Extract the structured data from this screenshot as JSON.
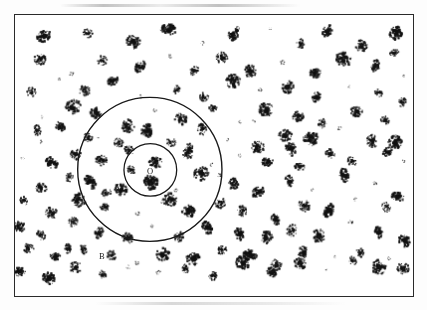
{
  "figure": {
    "type": "spatial-point-pattern",
    "frame": {
      "x": 14,
      "y": 14,
      "width": 400,
      "height": 283,
      "border_color": "#2a2a2a",
      "border_width": 1.6,
      "background_color": "#ffffff"
    },
    "ink_color": "#111111",
    "page_background": "#fdfdfd"
  },
  "labels": [
    {
      "id": "label-o",
      "text": "O",
      "x": 149,
      "y": 171,
      "note": "centre of the concentric circles, inside the small circle"
    },
    {
      "id": "label-a",
      "text": "A",
      "x": 116,
      "y": 187,
      "note": "annulus between the inner and outer circle"
    },
    {
      "id": "label-b",
      "text": "B",
      "x": 101,
      "y": 256,
      "note": "just outside the outer circle, lower left"
    }
  ],
  "circles": [
    {
      "id": "circle-inner",
      "cx": 150,
      "cy": 170,
      "r": 26.5,
      "stroke": "#1a1a1a",
      "stroke_width": 1.3
    },
    {
      "id": "circle-outer",
      "cx": 149.5,
      "cy": 169.5,
      "r": 72.5,
      "stroke": "#1a1a1a",
      "stroke_width": 1.4
    }
  ],
  "chart_data": {
    "type": "scatter",
    "title": "",
    "subtitle": "",
    "xlabel": "",
    "ylabel": "",
    "xlim": [
      0,
      400
    ],
    "ylim": [
      0,
      283
    ],
    "grid": false,
    "legend": null,
    "annotations": [
      {
        "text": "O",
        "x": 135,
        "y": 157
      },
      {
        "text": "A",
        "x": 102,
        "y": 173
      },
      {
        "text": "B",
        "x": 87,
        "y": 242
      }
    ],
    "overlays": [
      {
        "shape": "circle",
        "cx": 136,
        "cy": 156,
        "r": 26.5,
        "label": "inner circle about O"
      },
      {
        "shape": "circle",
        "cx": 135.5,
        "cy": 155.5,
        "r": 72.5,
        "label": "outer circle about O"
      }
    ],
    "marker_style": "irregular ink blob",
    "point_count": 178,
    "points": [
      [
        24,
        15
      ],
      [
        78,
        9
      ],
      [
        117,
        11
      ],
      [
        162,
        27
      ],
      [
        208,
        10
      ],
      [
        241,
        26
      ],
      [
        262,
        14
      ],
      [
        341,
        13
      ],
      [
        383,
        12
      ],
      [
        398,
        30
      ],
      [
        18,
        38
      ],
      [
        45,
        33
      ],
      [
        88,
        36
      ],
      [
        130,
        43
      ],
      [
        166,
        31
      ],
      [
        200,
        41
      ],
      [
        234,
        35
      ],
      [
        272,
        27
      ],
      [
        299,
        40
      ],
      [
        331,
        33
      ],
      [
        360,
        45
      ],
      [
        392,
        52
      ],
      [
        12,
        63
      ],
      [
        41,
        57
      ],
      [
        73,
        70
      ],
      [
        101,
        58
      ],
      [
        137,
        64
      ],
      [
        170,
        55
      ],
      [
        194,
        67
      ],
      [
        222,
        60
      ],
      [
        250,
        73
      ],
      [
        281,
        62
      ],
      [
        313,
        70
      ],
      [
        347,
        58
      ],
      [
        378,
        66
      ],
      [
        403,
        74
      ],
      [
        9,
        86
      ],
      [
        33,
        93
      ],
      [
        60,
        80
      ],
      [
        85,
        90
      ],
      [
        113,
        83
      ],
      [
        142,
        95
      ],
      [
        176,
        86
      ],
      [
        205,
        97
      ],
      [
        233,
        84
      ],
      [
        258,
        92
      ],
      [
        289,
        86
      ],
      [
        318,
        98
      ],
      [
        352,
        88
      ],
      [
        382,
        95
      ],
      [
        404,
        104
      ],
      [
        15,
        110
      ],
      [
        44,
        118
      ],
      [
        69,
        106
      ],
      [
        96,
        115
      ],
      [
        124,
        123
      ],
      [
        152,
        108
      ],
      [
        181,
        118
      ],
      [
        210,
        110
      ],
      [
        240,
        120
      ],
      [
        268,
        107
      ],
      [
        296,
        116
      ],
      [
        325,
        122
      ],
      [
        354,
        112
      ],
      [
        384,
        120
      ],
      [
        7,
        132
      ],
      [
        36,
        140
      ],
      [
        62,
        129
      ],
      [
        88,
        137
      ],
      [
        115,
        145
      ],
      [
        145,
        134
      ],
      [
        172,
        142
      ],
      [
        199,
        131
      ],
      [
        228,
        139
      ],
      [
        256,
        147
      ],
      [
        285,
        133
      ],
      [
        312,
        141
      ],
      [
        341,
        130
      ],
      [
        370,
        138
      ],
      [
        398,
        145
      ],
      [
        20,
        156
      ],
      [
        48,
        163
      ],
      [
        75,
        154
      ],
      [
        102,
        161
      ],
      [
        128,
        151
      ],
      [
        158,
        166
      ],
      [
        186,
        157
      ],
      [
        214,
        164
      ],
      [
        243,
        153
      ],
      [
        271,
        161
      ],
      [
        300,
        168
      ],
      [
        328,
        155
      ],
      [
        356,
        163
      ],
      [
        386,
        152
      ],
      [
        406,
        160
      ],
      [
        11,
        178
      ],
      [
        38,
        186
      ],
      [
        66,
        176
      ],
      [
        93,
        184
      ],
      [
        120,
        192
      ],
      [
        148,
        180
      ],
      [
        175,
        188
      ],
      [
        204,
        177
      ],
      [
        232,
        185
      ],
      [
        260,
        193
      ],
      [
        288,
        181
      ],
      [
        316,
        189
      ],
      [
        345,
        178
      ],
      [
        373,
        186
      ],
      [
        400,
        194
      ],
      [
        24,
        202
      ],
      [
        52,
        210
      ],
      [
        79,
        200
      ],
      [
        106,
        208
      ],
      [
        134,
        216
      ],
      [
        161,
        204
      ],
      [
        189,
        212
      ],
      [
        217,
        201
      ],
      [
        245,
        209
      ],
      [
        274,
        217
      ],
      [
        302,
        205
      ],
      [
        330,
        213
      ],
      [
        358,
        202
      ],
      [
        387,
        210
      ],
      [
        16,
        226
      ],
      [
        43,
        234
      ],
      [
        70,
        224
      ],
      [
        98,
        232
      ],
      [
        126,
        240
      ],
      [
        153,
        228
      ],
      [
        181,
        236
      ],
      [
        209,
        225
      ],
      [
        237,
        233
      ],
      [
        265,
        241
      ],
      [
        293,
        229
      ],
      [
        322,
        237
      ],
      [
        350,
        226
      ],
      [
        378,
        234
      ],
      [
        404,
        242
      ],
      [
        28,
        250
      ],
      [
        56,
        258
      ],
      [
        83,
        248
      ],
      [
        110,
        256
      ],
      [
        138,
        264
      ],
      [
        165,
        252
      ],
      [
        193,
        260
      ],
      [
        221,
        249
      ],
      [
        249,
        257
      ],
      [
        277,
        265
      ],
      [
        305,
        253
      ],
      [
        333,
        261
      ],
      [
        361,
        250
      ],
      [
        389,
        258
      ],
      [
        20,
        272
      ],
      [
        48,
        278
      ],
      [
        76,
        270
      ],
      [
        104,
        276
      ],
      [
        131,
        268
      ],
      [
        159,
        275
      ],
      [
        187,
        267
      ],
      [
        215,
        274
      ],
      [
        243,
        266
      ],
      [
        271,
        273
      ],
      [
        299,
        265
      ],
      [
        327,
        272
      ],
      [
        355,
        264
      ],
      [
        383,
        271
      ],
      [
        406,
        266
      ],
      [
        36,
        128
      ],
      [
        64,
        250
      ],
      [
        190,
        145
      ],
      [
        222,
        175
      ],
      [
        130,
        170
      ],
      [
        152,
        182
      ],
      [
        96,
        140
      ],
      [
        108,
        195
      ],
      [
        168,
        200
      ],
      [
        198,
        255
      ],
      [
        256,
        118
      ],
      [
        288,
        150
      ]
    ]
  }
}
